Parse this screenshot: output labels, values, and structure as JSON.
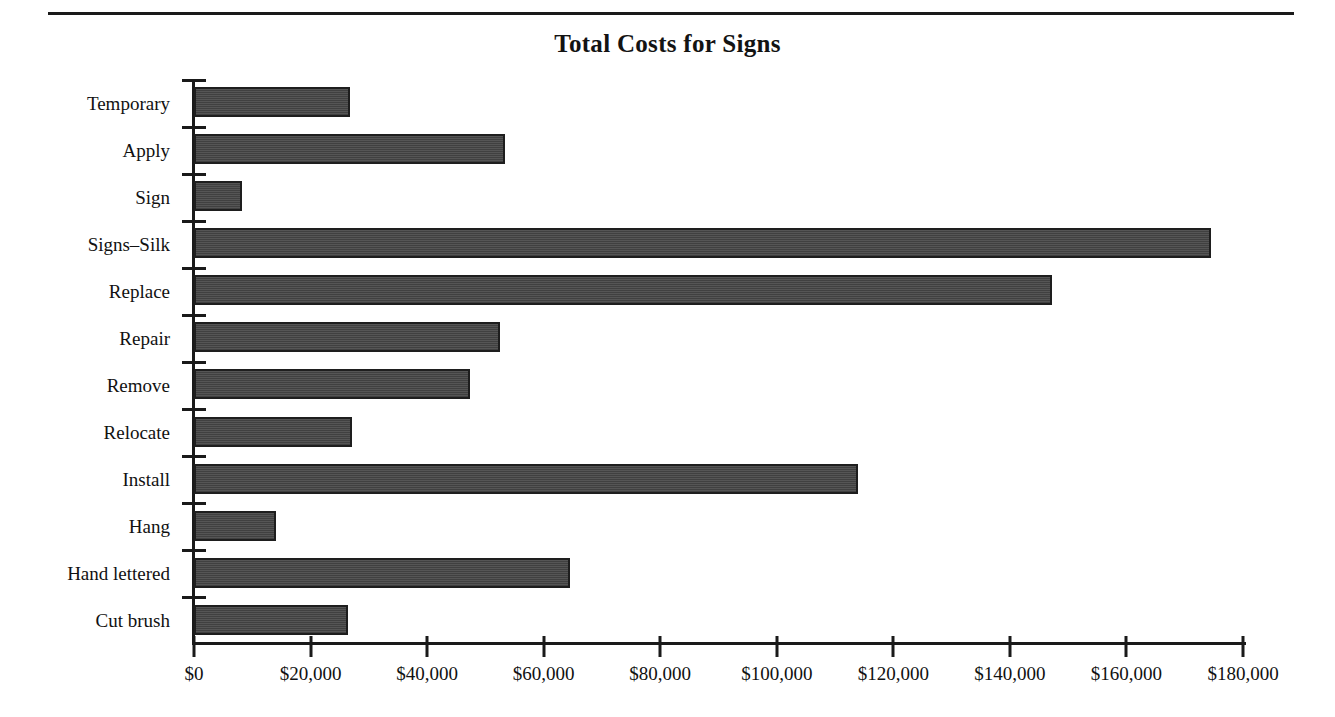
{
  "chart_data": {
    "type": "bar",
    "orientation": "horizontal",
    "title": "Total Costs for Signs",
    "xlabel": "",
    "ylabel": "",
    "xlim": [
      0,
      180000
    ],
    "grid": false,
    "legend": false,
    "bar_color": "#4c4c4c",
    "bar_border_color": "#1e1e1e",
    "axis_color": "#1a1a1a",
    "categories": [
      "Temporary",
      "Apply",
      "Sign",
      "Signs–Silk",
      "Replace",
      "Repair",
      "Remove",
      "Relocate",
      "Install",
      "Hang",
      "Hand lettered",
      "Cut brush"
    ],
    "values": [
      26800,
      53300,
      8200,
      174500,
      147300,
      52500,
      47300,
      27100,
      113900,
      14100,
      64500,
      26400
    ],
    "xticks": [
      0,
      20000,
      40000,
      60000,
      80000,
      100000,
      120000,
      140000,
      160000,
      180000
    ],
    "xtick_labels": [
      "$0",
      "$20,000",
      "$40,000",
      "$60,000",
      "$80,000",
      "$100,000",
      "$120,000",
      "$140,000",
      "$160,000",
      "$180,000"
    ]
  }
}
